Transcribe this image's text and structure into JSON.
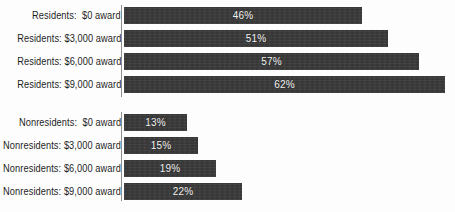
{
  "chart_data": {
    "type": "bar",
    "orientation": "horizontal",
    "title": "",
    "subtitle": "",
    "xlabel": "",
    "ylabel": "",
    "xlim": [
      0,
      64
    ],
    "grid": false,
    "legend": null,
    "value_suffix": "%",
    "categories": [
      "Residents:  $0 award",
      "Residents: $3,000 award",
      "Residents: $6,000 award",
      "Residents: $9,000 award",
      "Nonresidents:  $0 award",
      "Nonresidents: $3,000 award",
      "Nonresidents: $6,000 award",
      "Nonresidents: $9,000 award"
    ],
    "values": [
      46,
      51,
      57,
      62,
      13,
      15,
      19,
      22
    ],
    "data_labels": [
      "46%",
      "51%",
      "57%",
      "62%",
      "13%",
      "15%",
      "19%",
      "22%"
    ],
    "groups": [
      {
        "name": "Residents",
        "categories": [
          "Residents:  $0 award",
          "Residents: $3,000 award",
          "Residents: $6,000 award",
          "Residents: $9,000 award"
        ],
        "values": [
          46,
          51,
          57,
          62
        ],
        "data_labels": [
          "46%",
          "51%",
          "57%",
          "62%"
        ]
      },
      {
        "name": "Nonresidents",
        "categories": [
          "Nonresidents:  $0 award",
          "Nonresidents: $3,000 award",
          "Nonresidents: $6,000 award",
          "Nonresidents: $9,000 award"
        ],
        "values": [
          13,
          15,
          19,
          22
        ],
        "data_labels": [
          "13%",
          "15%",
          "19%",
          "22%"
        ]
      }
    ]
  },
  "style": {
    "bar_color": "#3b3b3b",
    "value_label_color": "#f4f4f4",
    "category_label_color": "#1d1d1d",
    "axis_color": "#8d8d8d",
    "background": "#fefefe"
  },
  "rows": [
    {
      "label": "Residents:  $0 award",
      "value_label": "46%",
      "value": 46,
      "top": 7,
      "width": 238
    },
    {
      "label": "Residents: $3,000 award",
      "value_label": "51%",
      "value": 51,
      "top": 30,
      "width": 264
    },
    {
      "label": "Residents: $6,000 award",
      "value_label": "57%",
      "value": 57,
      "top": 53,
      "width": 295
    },
    {
      "label": "Residents: $9,000 award",
      "value_label": "62%",
      "value": 62,
      "top": 76,
      "width": 321
    },
    {
      "label": "Nonresidents:  $0 award",
      "value_label": "13%",
      "value": 13,
      "top": 114,
      "width": 63
    },
    {
      "label": "Nonresidents: $3,000 award",
      "value_label": "15%",
      "value": 15,
      "top": 137,
      "width": 74
    },
    {
      "label": "Nonresidents: $6,000 award",
      "value_label": "19%",
      "value": 19,
      "top": 160,
      "width": 92
    },
    {
      "label": "Nonresidents: $9,000 award",
      "value_label": "22%",
      "value": 22,
      "top": 183,
      "width": 118
    }
  ],
  "axis_segments": [
    {
      "top": 5,
      "height": 92
    },
    {
      "top": 112,
      "height": 89
    }
  ]
}
